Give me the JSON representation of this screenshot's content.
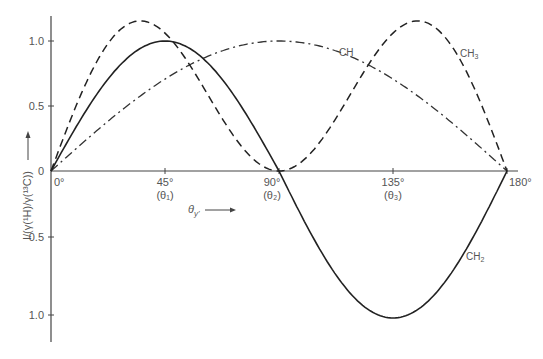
{
  "chart_data": {
    "type": "line",
    "title": "",
    "xlabel": "θ_y'",
    "ylabel": "I/(γ(¹H)/γ(¹³C))",
    "x_ticks": [
      {
        "value": 0,
        "label": "0°",
        "sub": ""
      },
      {
        "value": 45,
        "label": "45°",
        "sub": "(θ₁)"
      },
      {
        "value": 90,
        "label": "90°",
        "sub": "(θ₂)"
      },
      {
        "value": 135,
        "label": "135°",
        "sub": "(θ₃)"
      },
      {
        "value": 180,
        "label": "180°",
        "sub": ""
      }
    ],
    "y_ticks_positive": [
      "0",
      "0.5",
      "1.0"
    ],
    "y_ticks_negative": [
      "0.5",
      "1.0"
    ],
    "xlim": [
      0,
      180
    ],
    "ylim": [
      -1.0,
      1.15
    ],
    "grid": false,
    "legend": "inline curve labels",
    "x": [
      0,
      15,
      30,
      35,
      45,
      60,
      75,
      90,
      105,
      120,
      135,
      145,
      150,
      165,
      180
    ],
    "series": [
      {
        "name": "CH",
        "style": "dash-dot",
        "formula": "sin θ",
        "values": [
          0,
          0.26,
          0.5,
          0.57,
          0.71,
          0.87,
          0.97,
          1.0,
          0.97,
          0.87,
          0.71,
          0.57,
          0.5,
          0.26,
          0
        ]
      },
      {
        "name": "CH₂",
        "style": "solid",
        "formula": "sin 2θ",
        "values": [
          0,
          0.5,
          0.87,
          0.94,
          1.0,
          0.87,
          0.5,
          0,
          -0.5,
          -0.87,
          -1.0,
          -0.94,
          -0.87,
          -0.5,
          0
        ]
      },
      {
        "name": "CH₃",
        "style": "dashed",
        "formula": "3 sin θ cos² θ",
        "values": [
          0,
          0.72,
          1.13,
          1.15,
          1.06,
          0.65,
          0.19,
          0,
          0.19,
          0.65,
          1.06,
          1.15,
          1.13,
          0.72,
          0
        ]
      }
    ],
    "annotations": [
      "CH",
      "CH₃",
      "CH₂",
      "θ_y' →"
    ]
  },
  "labels": {
    "ch": "CH",
    "ch2_main": "CH",
    "ch2_sub": "2",
    "ch3_main": "CH",
    "ch3_sub": "3",
    "xaxis_title": "θ",
    "xaxis_sub": "y'",
    "yaxis_title": "I/(γ(¹H)/γ(¹³C))"
  },
  "ticks": {
    "x0": "0°",
    "x45": "45°",
    "x45sub": "(θ₁)",
    "x90": "90°",
    "x90sub": "(θ₂)",
    "x135": "135°",
    "x135sub": "(θ₃)",
    "x180": "180°",
    "y0": "0",
    "yp05": "0.5",
    "yp10": "1.0",
    "yn05": "0.5",
    "yn10": "1.0"
  }
}
